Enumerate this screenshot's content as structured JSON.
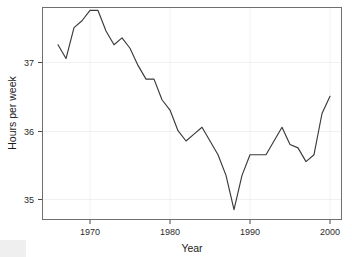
{
  "chart_data": {
    "type": "line",
    "title": "",
    "xlabel": "Year",
    "ylabel": "Hours per week",
    "xlim": [
      1964.0,
      2001.5
    ],
    "ylim": [
      34.65,
      37.75
    ],
    "xticks": [
      1970,
      1980,
      1990,
      2000
    ],
    "xtick_labels": [
      "1970",
      "1980",
      "1990",
      "2000"
    ],
    "yticks": [
      35,
      36,
      37
    ],
    "ytick_labels": [
      "35",
      "36",
      "37"
    ],
    "grid": true,
    "legend": "none",
    "line_color": "#3a3a3a",
    "panel_border_color": "#6f6f6f",
    "grid_color": "#ededed",
    "x": [
      1966,
      1967,
      1968,
      1969,
      1970,
      1971,
      1972,
      1973,
      1974,
      1975,
      1976,
      1977,
      1978,
      1979,
      1980,
      1981,
      1982,
      1983,
      1984,
      1985,
      1986,
      1987,
      1988,
      1989,
      1990,
      1991,
      1992,
      1993,
      1994,
      1995,
      1996,
      1997,
      1998,
      1999,
      2000
    ],
    "values": [
      37.2,
      37.0,
      37.45,
      37.55,
      37.7,
      37.7,
      37.4,
      37.2,
      37.3,
      37.15,
      36.9,
      36.7,
      36.7,
      36.4,
      36.25,
      35.95,
      35.8,
      35.9,
      36.0,
      35.8,
      35.6,
      35.3,
      34.8,
      35.3,
      35.6,
      35.6,
      35.6,
      35.8,
      36.0,
      35.75,
      35.7,
      35.5,
      35.6,
      36.2,
      36.45
    ],
    "series": [
      {
        "name": "Hours per week",
        "values": [
          37.2,
          37.0,
          37.45,
          37.55,
          37.7,
          37.7,
          37.4,
          37.2,
          37.3,
          37.15,
          36.9,
          36.7,
          36.7,
          36.4,
          36.25,
          35.95,
          35.8,
          35.9,
          36.0,
          35.8,
          35.6,
          35.3,
          34.8,
          35.3,
          35.6,
          35.6,
          35.6,
          35.8,
          36.0,
          35.75,
          35.7,
          35.5,
          35.6,
          36.2,
          36.45
        ]
      }
    ]
  },
  "axes": {
    "y_title": "Hours per week",
    "x_title": "Year",
    "y_tick_labels": [
      "37",
      "36",
      "35"
    ],
    "x_tick_labels": [
      "1970",
      "1980",
      "1990",
      "2000"
    ]
  }
}
